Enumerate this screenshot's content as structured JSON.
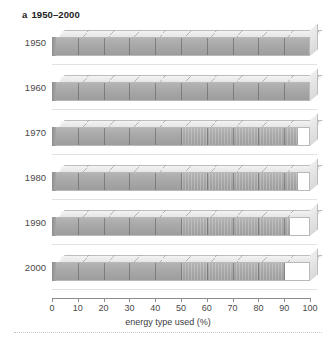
{
  "figure": {
    "panel_letter": "a",
    "panel_title": "1950–2000",
    "axis_title": "energy type used (%)",
    "axis_ticks": [
      "0",
      "10",
      "20",
      "30",
      "40",
      "50",
      "60",
      "70",
      "80",
      "90",
      "100"
    ],
    "colors": {
      "bar_fill": "#a8a8a8",
      "bar_empty": "#ffffff",
      "bar_top_face": "#ebebeb",
      "outline": "#b9b9b9",
      "text": "#3a3a3a"
    }
  },
  "chart_data": {
    "type": "bar",
    "xlabel": "energy type used (%)",
    "ylabel": "",
    "xlim": [
      0,
      100
    ],
    "grid": false,
    "legend": null,
    "orientation": "horizontal",
    "segments_per_bar": 10,
    "categories": [
      "1950",
      "1960",
      "1970",
      "1980",
      "1990",
      "2000"
    ],
    "values": [
      100,
      100,
      95,
      95,
      92,
      90
    ],
    "series": [
      {
        "name": "energy type used (%)",
        "values": [
          100,
          100,
          95,
          95,
          92,
          90
        ]
      }
    ]
  },
  "rows": [
    {
      "year": "1950",
      "value": 100
    },
    {
      "year": "1960",
      "value": 100
    },
    {
      "year": "1970",
      "value": 95
    },
    {
      "year": "1980",
      "value": 95
    },
    {
      "year": "1990",
      "value": 92
    },
    {
      "year": "2000",
      "value": 90
    }
  ]
}
